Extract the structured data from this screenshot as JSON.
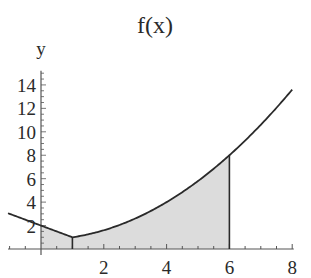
{
  "chart_data": {
    "type": "area",
    "title": "f(x)",
    "xlabel": "x",
    "ylabel": "y",
    "xlim": [
      -1.3,
      8.2
    ],
    "ylim": [
      0,
      15
    ],
    "x_ticks": [
      2,
      4,
      6,
      8
    ],
    "y_ticks": [
      2,
      4,
      6,
      8,
      10,
      12,
      14
    ],
    "grid": false,
    "legend": null,
    "function": {
      "description": "piecewise: f(x) = 2 - x for x <= 1; f(x) = (x^2 + 4)/5 for x > 1",
      "domain": [
        -1.05,
        8.0
      ],
      "key_points": [
        {
          "x": -1.05,
          "y": 3.05
        },
        {
          "x": 0,
          "y": 2.0
        },
        {
          "x": 1,
          "y": 1.0
        },
        {
          "x": 2,
          "y": 1.6
        },
        {
          "x": 3,
          "y": 2.6
        },
        {
          "x": 4,
          "y": 4.0
        },
        {
          "x": 5,
          "y": 5.8
        },
        {
          "x": 6,
          "y": 8.0
        },
        {
          "x": 7,
          "y": 10.6
        },
        {
          "x": 8,
          "y": 13.6
        }
      ]
    },
    "shaded_region": {
      "from_x": 0,
      "to_x": 6,
      "fill": "#d9d9d9",
      "vertical_lines_at": [
        1,
        6
      ]
    },
    "colors": {
      "curve": "#2a2a2a",
      "axis": "#555555",
      "shade": "#dcdcdc"
    }
  }
}
